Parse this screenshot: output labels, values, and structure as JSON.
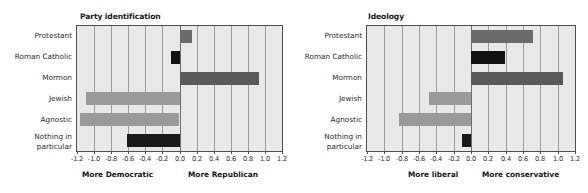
{
  "figure": {
    "suptitle": "",
    "background": "#ffffff"
  },
  "colors": {
    "plot_background": "#e8e8e8",
    "frame": "#4f4f4f",
    "gridline": "#9d9d9d",
    "bar_protestant": "#6b6b6b",
    "bar_roman_catholic": "#121212",
    "bar_mormon": "#595959",
    "bar_jewish": "#9a9a9a",
    "bar_agnostic": "#9a9a9a",
    "bar_nothing": "#1a1a1a"
  },
  "chart_data": [
    {
      "type": "bar",
      "orientation": "horizontal",
      "title": "Party identification",
      "xlabel": "",
      "ylabel": "",
      "xlim": [
        -1.2,
        1.2
      ],
      "grid": true,
      "legend": null,
      "categories": [
        "Protestant",
        "Roman Catholic",
        "Mormon",
        "Jewish",
        "Agnostic",
        "Nothing in particular"
      ],
      "values": [
        0.14,
        -0.1,
        0.92,
        -1.1,
        -1.16,
        -0.62
      ],
      "bar_colors": [
        "#6b6b6b",
        "#121212",
        "#595959",
        "#9a9a9a",
        "#9a9a9a",
        "#1a1a1a"
      ],
      "xticks": [
        "-1.2",
        "-1.0",
        "-0.8",
        "-0.6",
        "-0.4",
        "-0.2",
        "0.0",
        "0.2",
        "0.4",
        "0.6",
        "0.8",
        "1.0",
        "1.2"
      ],
      "xtick_values": [
        -1.2,
        -1.0,
        -0.8,
        -0.6,
        -0.4,
        -0.2,
        0.0,
        0.2,
        0.4,
        0.6,
        0.8,
        1.0,
        1.2
      ],
      "left_end_label": "More Democratic",
      "right_end_label": "More Republican"
    },
    {
      "type": "bar",
      "orientation": "horizontal",
      "title": "Ideology",
      "xlabel": "",
      "ylabel": "",
      "xlim": [
        -1.2,
        1.2
      ],
      "grid": true,
      "legend": null,
      "categories": [
        "Protestant",
        "Roman Catholic",
        "Mormon",
        "Jewish",
        "Agnostic",
        "Nothing in particular"
      ],
      "values": [
        0.71,
        0.39,
        1.06,
        -0.48,
        -0.83,
        -0.1
      ],
      "bar_colors": [
        "#6b6b6b",
        "#121212",
        "#595959",
        "#9a9a9a",
        "#9a9a9a",
        "#1a1a1a"
      ],
      "xticks": [
        "-1.2",
        "-1.0",
        "-0.8",
        "-0.6",
        "-0.4",
        "-0.2",
        "0.0",
        "0.2",
        "0.4",
        "0.6",
        "0.8",
        "1.0",
        "1.2"
      ],
      "xtick_values": [
        -1.2,
        -1.0,
        -0.8,
        -0.6,
        -0.4,
        -0.2,
        0.0,
        0.2,
        0.4,
        0.6,
        0.8,
        1.0,
        1.2
      ],
      "left_end_label": "More liberal",
      "right_end_label": "More  conservative"
    }
  ]
}
